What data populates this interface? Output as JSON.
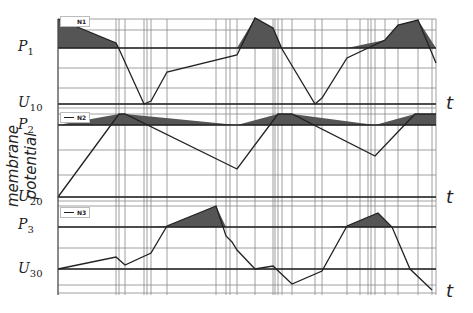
{
  "chart_data": {
    "type": "line",
    "title": "",
    "ylabel": "membrane potential",
    "xlabel": "t",
    "panels": [
      {
        "name": "N1",
        "threshold_label": "P",
        "threshold_sub": "1",
        "rest_label": "U",
        "rest_sub": "10",
        "t_label": "t",
        "points_x": [
          58,
          116,
          119,
          144,
          151,
          167,
          237,
          255,
          273,
          282,
          315,
          322,
          347,
          385,
          398,
          418,
          436
        ],
        "points_y": [
          19,
          43,
          49,
          104,
          101,
          72,
          55,
          18,
          28,
          49,
          104,
          98,
          58,
          40,
          25,
          20,
          63
        ],
        "shaded_regions": [
          [
            58,
            119
          ],
          [
            237,
            282
          ],
          [
            385,
            418
          ]
        ]
      },
      {
        "name": "N2",
        "threshold_label": "P",
        "threshold_sub": "2",
        "rest_label": "U",
        "rest_sub": "20",
        "t_label": "t",
        "points_x": [
          58,
          119,
          125,
          237,
          278,
          292,
          375,
          415,
          436
        ],
        "points_y": [
          197,
          114,
          114,
          169,
          114,
          114,
          156,
          114,
          114
        ],
        "shaded_regions": [
          [
            116,
            138
          ],
          [
            275,
            315
          ],
          [
            405,
            436
          ]
        ]
      },
      {
        "name": "N3",
        "threshold_label": "P",
        "threshold_sub": "3",
        "rest_label": "U",
        "rest_sub": "30",
        "t_label": "t",
        "points_x": [
          58,
          116,
          125,
          151,
          167,
          216,
          226,
          232,
          237,
          255,
          273,
          292,
          322,
          347,
          378,
          392,
          410,
          432
        ],
        "points_y": [
          269,
          257,
          265,
          253,
          226,
          206,
          236,
          242,
          250,
          269,
          266,
          284,
          271,
          226,
          213,
          227,
          269,
          290
        ],
        "shaded_regions": [
          [
            167,
            226
          ],
          [
            347,
            392
          ]
        ]
      }
    ],
    "vertical_gridlines_x": [
      58,
      116,
      119,
      125,
      144,
      147,
      151,
      167,
      216,
      226,
      230,
      237,
      255,
      273,
      275,
      278,
      282,
      292,
      315,
      322,
      347,
      360,
      368,
      371,
      375,
      385,
      398,
      418,
      432,
      436
    ],
    "grid": true,
    "legend_position": "top-left of each panel"
  }
}
